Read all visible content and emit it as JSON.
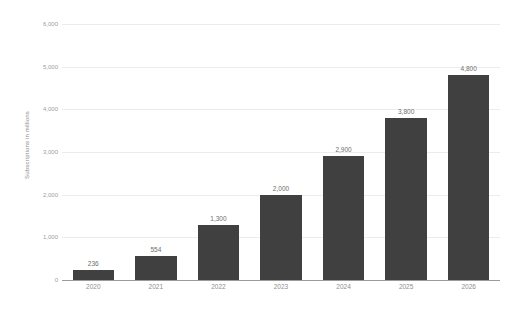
{
  "chart_data": {
    "type": "bar",
    "title": "",
    "subtitle": "",
    "xlabel": "",
    "ylabel": "Subscriptions in millions",
    "categories": [
      "2020",
      "2021",
      "2022",
      "2023",
      "2024",
      "2025",
      "2026"
    ],
    "values": [
      236,
      554,
      1300,
      2000,
      2900,
      3800,
      4800
    ],
    "value_labels": [
      "236",
      "554",
      "1,300",
      "2,000",
      "2,900",
      "3,800",
      "4,800"
    ],
    "ylim": [
      0,
      6000
    ],
    "y_ticks": [
      0,
      1000,
      2000,
      3000,
      4000,
      5000,
      6000
    ],
    "y_tick_labels": [
      "0",
      "1,000",
      "2,000",
      "3,000",
      "4,000",
      "5,000",
      "6,000"
    ],
    "grid": true,
    "legend": "none",
    "series": [
      {
        "name": "Subscriptions in millions",
        "values": [
          236,
          554,
          1300,
          2000,
          2900,
          3800,
          4800
        ]
      }
    ],
    "colors": {
      "bar": "#404040",
      "gridline": "#ececed",
      "axis_line": "#9b9b9b",
      "tick_text": "#9d9d9d",
      "value_text": "#6e6e6e",
      "axis_title_text": "#8a8a8a",
      "background": "#ffffff"
    }
  }
}
